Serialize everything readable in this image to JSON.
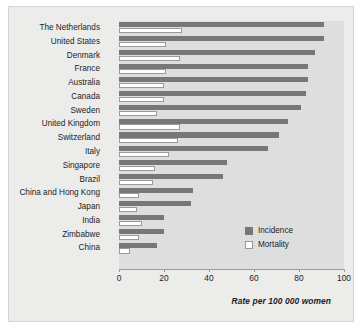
{
  "chart_data": {
    "type": "bar",
    "orientation": "horizontal",
    "title": "",
    "xlabel": "Rate per 100 000 women",
    "ylabel": "",
    "xlim": [
      0,
      100
    ],
    "xticks": [
      0,
      20,
      40,
      60,
      80,
      100
    ],
    "grid": false,
    "legend_position": "inside-right",
    "categories": [
      "The Netherlands",
      "United States",
      "Denmark",
      "France",
      "Australia",
      "Canada",
      "Sweden",
      "United Kingdom",
      "Switzerland",
      "Italy",
      "Singapore",
      "Brazil",
      "China and Hong Kong",
      "Japan",
      "India",
      "Zimbabwe",
      "China"
    ],
    "series": [
      {
        "name": "Incidence",
        "color": "#77777a",
        "values": [
          91,
          91,
          87,
          84,
          84,
          83,
          81,
          75,
          71,
          66,
          48,
          46,
          33,
          32,
          20,
          20,
          17
        ]
      },
      {
        "name": "Mortality",
        "color": "#ffffff",
        "values": [
          28,
          21,
          27,
          21,
          20,
          20,
          17,
          27,
          26,
          22,
          16,
          15,
          9,
          8,
          10,
          9,
          5
        ]
      }
    ]
  },
  "legend": {
    "items": [
      {
        "label": "Incidence",
        "swatch": "incidence-swatch"
      },
      {
        "label": "Mortality",
        "swatch": "mortality-swatch"
      }
    ]
  },
  "axis": {
    "x_title": "Rate per 100 000 women",
    "tick_labels": [
      "0",
      "20",
      "40",
      "60",
      "80",
      "100"
    ]
  }
}
